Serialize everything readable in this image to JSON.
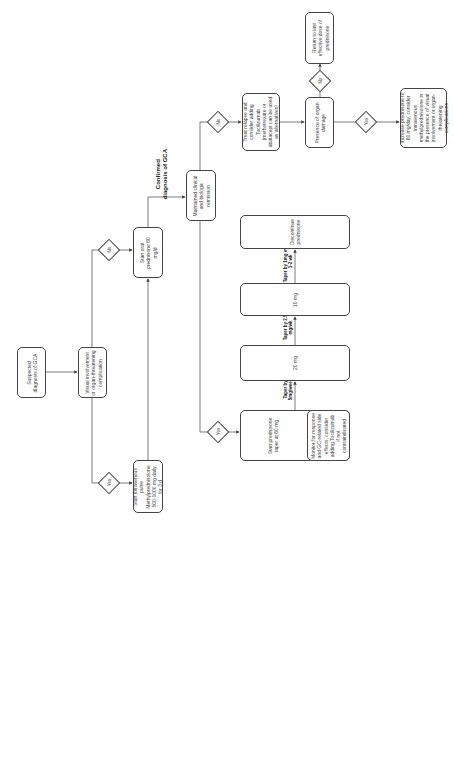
{
  "diagram": {
    "orientation": "rotated-90-ccw",
    "nodes": {
      "suspected": "Suspected diagnosis of GCA",
      "visual": "Visual involvement or organ-threatening complication",
      "iv_pulse": "Start intravenous pulse Methylprednisolone 500-1000 mg daily for 3 d",
      "oral_pred": "Start oral prednisone 60 mg/d",
      "maintained": "Maintained clinical and biologic remission",
      "treat_relapse": "Treat relapse and consider adding Tocilizumab (methotrexate or abatacept can be used as alternatives)",
      "organ_damage": "Presence of organ damage",
      "return_dose": "Return to last effective dose of prednisone",
      "increase_pred": "Increase prednisone to 60 mg/day, consider intravenous methylprednisolone in the presence of visual involvement or organ-threatening complications",
      "taper_start": "Start prednisone taper at 60 mg",
      "monitor": "Monitor for response and GC-related side effects, consider adding Tocilizumab if not contraindicated",
      "dose_20": "20 mg",
      "dose_10": "10 mg",
      "discontinue": "Discontinue prednisone"
    },
    "decisions": {
      "yes": "Yes",
      "no": "No"
    },
    "edge_labels": {
      "confirmed": "Confirmed diagnosis of GCA",
      "taper1": "Taper by 5mg/week",
      "taper2": "Taper by 2.5 mg/wk",
      "taper3": "Taper by 1mg every 1-2 wk"
    },
    "colors": {
      "line": "#444444",
      "background": "#ffffff"
    }
  }
}
